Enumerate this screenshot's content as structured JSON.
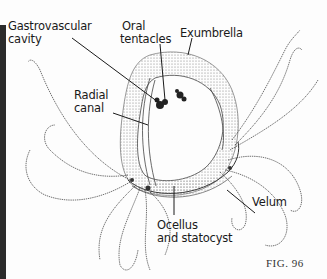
{
  "figure": {
    "caption": "FIG. 96",
    "colors": {
      "ink": "#1a1a1a",
      "stipple": "#777777",
      "background": "#fdfdfd",
      "edge_strip": "#2b2b2b"
    }
  },
  "labels": {
    "gastrovascular": {
      "line1": "Gastrovascular",
      "line2": "cavity"
    },
    "oral": {
      "line1": "Oral",
      "line2": "tentacles"
    },
    "exumbrella": {
      "line1": "Exumbrella"
    },
    "radial": {
      "line1": "Radial",
      "line2": "canal"
    },
    "velum": {
      "line1": "Velum"
    },
    "ocellus": {
      "line1": "Ocellus",
      "line2": "and statocyst"
    }
  }
}
